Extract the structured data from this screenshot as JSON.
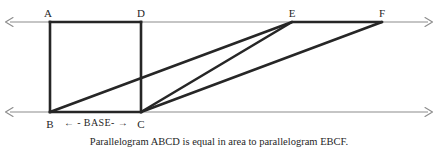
{
  "figure": {
    "caption": "Parallelogram ABCD is equal in area to parallelogram EBCF.",
    "base_annotation": "← - BASE- →",
    "colors": {
      "guide_line": "#8c8c8c",
      "shape_stroke": "#262626",
      "text": "#1f1f1f",
      "background": "#ffffff"
    },
    "labels": {
      "a": "A",
      "b": "B",
      "c": "C",
      "d": "D",
      "e": "E",
      "f": "F"
    }
  },
  "chart_data": {
    "type": "diagram",
    "title": "Parallelogram ABCD is equal in area to parallelogram EBCF.",
    "vertices": [
      {
        "name": "A",
        "x": 50,
        "y": 22,
        "label_x": 48,
        "label_y": 8
      },
      {
        "name": "D",
        "x": 141,
        "y": 22,
        "label_x": 141,
        "label_y": 8
      },
      {
        "name": "E",
        "x": 292,
        "y": 22,
        "label_x": 292,
        "label_y": 8
      },
      {
        "name": "F",
        "x": 382,
        "y": 22,
        "label_x": 382,
        "label_y": 8
      },
      {
        "name": "B",
        "x": 50,
        "y": 112,
        "label_x": 50,
        "label_y": 119
      },
      {
        "name": "C",
        "x": 141,
        "y": 112,
        "label_x": 141,
        "label_y": 119
      }
    ],
    "guide_lines": [
      {
        "name": "top-parallel-line",
        "x1": 5,
        "y1": 22,
        "x2": 432,
        "y2": 22,
        "arrows": "both"
      },
      {
        "name": "bottom-parallel-line",
        "x1": 5,
        "y1": 112,
        "x2": 432,
        "y2": 112,
        "arrows": "both"
      }
    ],
    "segments": [
      {
        "name": "AD",
        "x1": 50,
        "y1": 22,
        "x2": 141,
        "y2": 22
      },
      {
        "name": "AB",
        "x1": 50,
        "y1": 22,
        "x2": 50,
        "y2": 112
      },
      {
        "name": "DC",
        "x1": 141,
        "y1": 22,
        "x2": 141,
        "y2": 112
      },
      {
        "name": "BC",
        "x1": 50,
        "y1": 112,
        "x2": 141,
        "y2": 112
      },
      {
        "name": "BE",
        "x1": 50,
        "y1": 112,
        "x2": 292,
        "y2": 22
      },
      {
        "name": "CE",
        "x1": 141,
        "y1": 112,
        "x2": 292,
        "y2": 22
      },
      {
        "name": "CF",
        "x1": 141,
        "y1": 112,
        "x2": 382,
        "y2": 22
      },
      {
        "name": "EF",
        "x1": 292,
        "y1": 22,
        "x2": 382,
        "y2": 22
      }
    ],
    "base_annotation": {
      "text": "← - BASE- →",
      "x": 96,
      "y": 119,
      "from": "B",
      "to": "C"
    }
  }
}
